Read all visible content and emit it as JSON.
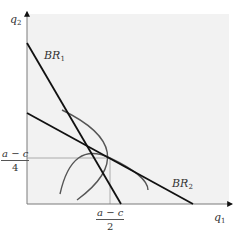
{
  "diagram": {
    "type": "best-response functions (Cournot duopoly)",
    "axes": {
      "x_label": {
        "base": "q",
        "sub": "1"
      },
      "y_label": {
        "base": "q",
        "sub": "2"
      }
    },
    "lines": [
      {
        "name": "BR1",
        "label": {
          "base": "BR",
          "sub": "1"
        }
      },
      {
        "name": "BR2",
        "label": {
          "base": "BR",
          "sub": "2"
        }
      }
    ],
    "tick_labels": {
      "y": {
        "numerator": "a − c",
        "denominator": "4"
      },
      "x": {
        "numerator": "a − c",
        "denominator": "2"
      }
    },
    "colors": {
      "background": "#f2f2f2",
      "axis": "#7a7a7a",
      "br_line": "#111111",
      "isoprofit": "#555555",
      "guide": "#999999"
    }
  }
}
